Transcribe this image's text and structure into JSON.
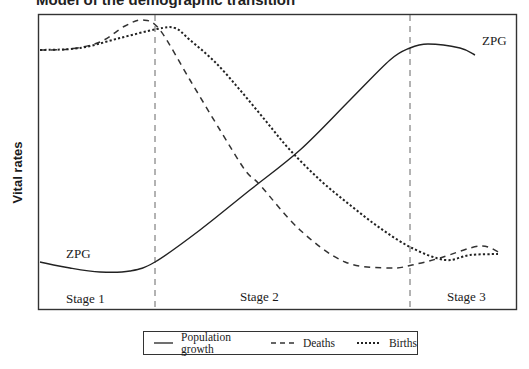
{
  "header": {
    "cropped_title": "Model of the demographic transition"
  },
  "chart_data": {
    "type": "line",
    "title": "",
    "xlabel": "",
    "ylabel": "Vital rates",
    "grid": false,
    "legend_position": "bottom",
    "stage_boundaries_px": [
      155,
      410
    ],
    "stages": [
      "Stage 1",
      "Stage 2",
      "Stage 3"
    ],
    "annotations": [
      {
        "text": "ZPG",
        "near": "population growth start (Stage 1)"
      },
      {
        "text": "ZPG",
        "near": "population growth end (Stage 3)"
      }
    ],
    "series": [
      {
        "name": "Population growth",
        "style": "solid",
        "points_px": [
          [
            40,
            262
          ],
          [
            70,
            268
          ],
          [
            100,
            272
          ],
          [
            130,
            271
          ],
          [
            155,
            262
          ],
          [
            200,
            230
          ],
          [
            250,
            190
          ],
          [
            300,
            150
          ],
          [
            350,
            100
          ],
          [
            390,
            60
          ],
          [
            410,
            48
          ],
          [
            428,
            44
          ],
          [
            460,
            48
          ],
          [
            475,
            55
          ]
        ]
      },
      {
        "name": "Deaths",
        "style": "dashed",
        "points_px": [
          [
            40,
            50
          ],
          [
            70,
            49
          ],
          [
            100,
            42
          ],
          [
            125,
            26
          ],
          [
            143,
            20
          ],
          [
            160,
            30
          ],
          [
            190,
            80
          ],
          [
            220,
            130
          ],
          [
            245,
            170
          ],
          [
            260,
            185
          ],
          [
            300,
            230
          ],
          [
            345,
            262
          ],
          [
            390,
            268
          ],
          [
            412,
            265
          ],
          [
            440,
            258
          ],
          [
            480,
            246
          ],
          [
            500,
            253
          ]
        ]
      },
      {
        "name": "Births",
        "style": "dotted",
        "points_px": [
          [
            40,
            50
          ],
          [
            80,
            48
          ],
          [
            120,
            38
          ],
          [
            157,
            29
          ],
          [
            175,
            28
          ],
          [
            190,
            40
          ],
          [
            215,
            62
          ],
          [
            240,
            90
          ],
          [
            265,
            120
          ],
          [
            290,
            150
          ],
          [
            320,
            180
          ],
          [
            350,
            205
          ],
          [
            380,
            228
          ],
          [
            412,
            248
          ],
          [
            445,
            260
          ],
          [
            470,
            255
          ],
          [
            498,
            254
          ]
        ]
      }
    ]
  },
  "labels": {
    "zpg_left": "ZPG",
    "zpg_right": "ZPG",
    "stage1": "Stage 1",
    "stage2": "Stage 2",
    "stage3": "Stage 3"
  },
  "legend": {
    "items": [
      {
        "label": "Population growth"
      },
      {
        "label": "Deaths"
      },
      {
        "label": "Births"
      }
    ]
  }
}
